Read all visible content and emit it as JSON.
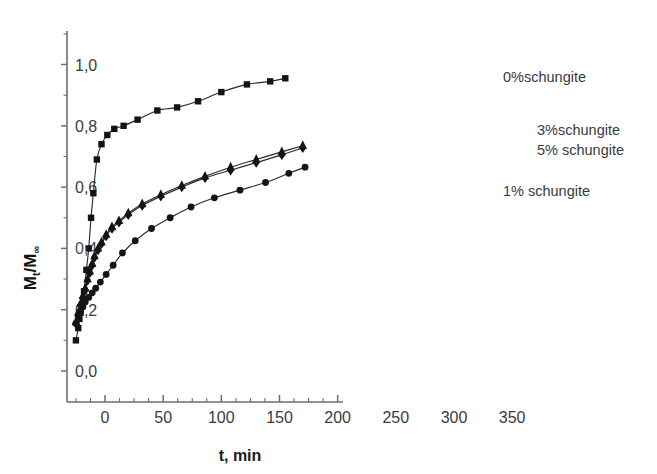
{
  "chart_data": {
    "type": "line",
    "title": "",
    "xlabel": "t, min",
    "ylabel": "Mt/M∞",
    "ylabel_main": "M",
    "ylabel_sub1": "t",
    "ylabel_slash": "/M",
    "ylabel_sub2": "∞",
    "xlim": [
      -25,
      200
    ],
    "ylim": [
      -0.06,
      1.1
    ],
    "grid": false,
    "legend_position": "right-inside",
    "xticks": [
      0,
      50,
      100,
      150,
      200,
      250,
      300,
      350
    ],
    "xtick_labels": [
      "0",
      "50",
      "100",
      "150",
      "200",
      "250",
      "300",
      "350"
    ],
    "xticks_drawn_max": 200,
    "xtick_minor_step": 12.5,
    "yticks": [
      0.0,
      0.2,
      0.4,
      0.6,
      0.8,
      1.0
    ],
    "ytick_labels": [
      "0,0",
      "0,2",
      "0,4",
      "0,6",
      "0,8",
      "1,0"
    ],
    "ytick_minor_step": 0.1,
    "ytick_label_obscured": {
      "value": 0.4,
      "note": "0,4 overlapped by data cluster, only '0' legible"
    },
    "series": [
      {
        "name": "0%schungite",
        "marker": "square",
        "label_x": 503,
        "label_y": 82,
        "x": [
          -25,
          -23,
          -22,
          -21,
          -20,
          -18,
          -16,
          -14,
          -12,
          -10,
          -7,
          -3,
          2,
          8,
          16,
          28,
          45,
          62,
          80,
          100,
          122,
          142,
          155
        ],
        "y": [
          0.1,
          0.14,
          0.17,
          0.19,
          0.21,
          0.26,
          0.33,
          0.4,
          0.5,
          0.58,
          0.69,
          0.74,
          0.77,
          0.79,
          0.8,
          0.82,
          0.85,
          0.86,
          0.88,
          0.91,
          0.935,
          0.945,
          0.955
        ]
      },
      {
        "name": "3%schungite",
        "marker": "triangle",
        "label_x": 537,
        "label_y": 135,
        "x": [
          -25,
          -23,
          -21,
          -19,
          -17,
          -15,
          -13,
          -11,
          -9,
          -6,
          -3,
          1,
          6,
          12,
          20,
          32,
          48,
          66,
          86,
          108,
          130,
          152,
          170
        ],
        "y": [
          0.16,
          0.19,
          0.22,
          0.245,
          0.27,
          0.3,
          0.325,
          0.35,
          0.375,
          0.4,
          0.42,
          0.445,
          0.47,
          0.49,
          0.515,
          0.545,
          0.575,
          0.605,
          0.635,
          0.665,
          0.69,
          0.715,
          0.735
        ]
      },
      {
        "name": "5% schungite",
        "marker": "diamond",
        "label_x": 537,
        "label_y": 155,
        "x": [
          -25,
          -23,
          -21,
          -19,
          -17,
          -15,
          -13,
          -11,
          -9,
          -6,
          -3,
          1,
          6,
          12,
          20,
          32,
          48,
          66,
          86,
          108,
          130,
          152,
          170
        ],
        "y": [
          0.155,
          0.185,
          0.215,
          0.24,
          0.265,
          0.295,
          0.32,
          0.345,
          0.37,
          0.395,
          0.415,
          0.44,
          0.465,
          0.485,
          0.51,
          0.54,
          0.57,
          0.6,
          0.63,
          0.655,
          0.68,
          0.705,
          0.728
        ]
      },
      {
        "name": "1% schungite",
        "marker": "circle",
        "label_x": 503,
        "label_y": 196,
        "x": [
          -25,
          -23,
          -21,
          -19,
          -17,
          -14,
          -11,
          -8,
          -4,
          1,
          7,
          15,
          26,
          40,
          56,
          74,
          94,
          116,
          138,
          158,
          172
        ],
        "y": [
          0.155,
          0.175,
          0.195,
          0.21,
          0.225,
          0.24,
          0.255,
          0.27,
          0.29,
          0.315,
          0.345,
          0.385,
          0.425,
          0.465,
          0.5,
          0.535,
          0.565,
          0.59,
          0.615,
          0.645,
          0.665
        ]
      }
    ]
  },
  "axes_geometry": {
    "x_at_t0_px": 105,
    "px_per_min": 1.1633,
    "y_at_0_px": 371,
    "px_per_unit": 306.5,
    "x_axis_left_px": 67,
    "x_axis_right_px": 343,
    "y_axis_top_px": 31,
    "y_axis_bottom_px": 402
  },
  "legend": {
    "items": [
      {
        "label": "0%schungite"
      },
      {
        "label": "3%schungite"
      },
      {
        "label": "5% schungite"
      },
      {
        "label": "1% schungite"
      }
    ]
  },
  "colors": {
    "ink": "#141414",
    "axis": "#6e6e6e",
    "label": "#3b3b3b",
    "background": "#ffffff"
  }
}
